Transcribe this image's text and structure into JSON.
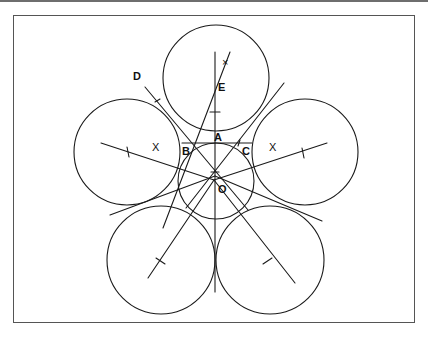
{
  "figure": {
    "labels": {
      "A": "A",
      "B": "B",
      "C": "C",
      "D": "D",
      "E": "E",
      "O": "O"
    },
    "marks": {
      "left_x": "X",
      "right_x": "X",
      "top_x": "×"
    },
    "stroke_color": "#1a1a1a",
    "frame_color": "#555555",
    "top_stripe_color": "#6e6e6e"
  }
}
